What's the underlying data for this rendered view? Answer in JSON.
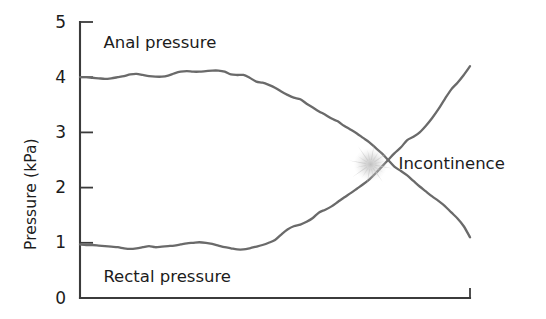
{
  "chart_data": {
    "type": "line",
    "title": "",
    "xlabel": "",
    "ylabel": "Pressure (kPa)",
    "ylim": [
      0,
      5
    ],
    "yticks": [
      0,
      1,
      2,
      3,
      4,
      5
    ],
    "ytick_labels": [
      "0",
      "1",
      "2",
      "3",
      "4",
      "5"
    ],
    "xlim": [
      0,
      100
    ],
    "xticks": [],
    "xtick_labels": [],
    "grid": false,
    "legend": "inline-labels",
    "line_color": "#6a6a6a",
    "axis_color": "#3b3b3b",
    "text_color": "#1c1c1c",
    "annotations": [
      {
        "label": "Incontinence",
        "marker": "starburst",
        "marker_color": "#c9c9c9",
        "x": 74.5,
        "y": 2.42
      }
    ],
    "series": [
      {
        "name": "Anal pressure",
        "label_x": 6,
        "label_y": 4.62,
        "x": [
          0.0,
          1.6,
          3.2,
          4.8,
          6.4,
          8.0,
          9.7,
          11.3,
          12.9,
          14.5,
          16.1,
          17.7,
          19.3,
          21.0,
          22.6,
          24.2,
          25.8,
          27.4,
          29.0,
          30.6,
          32.3,
          33.9,
          35.5,
          37.1,
          38.7,
          40.3,
          41.9,
          43.5,
          45.2,
          46.8,
          48.4,
          50.0,
          51.6,
          53.2,
          54.8,
          56.5,
          58.1,
          59.7,
          61.3,
          62.9,
          64.5,
          66.1,
          67.7,
          69.4,
          71.0,
          72.6,
          74.2,
          75.8,
          77.4,
          79.0,
          80.6,
          82.3,
          83.9,
          85.5,
          87.1,
          88.7,
          90.3,
          91.9,
          93.5,
          95.2,
          96.8,
          98.4,
          100.0
        ],
        "y": [
          4.0,
          4.0,
          3.99,
          3.98,
          3.97,
          3.98,
          4.0,
          4.02,
          4.05,
          4.06,
          4.04,
          4.02,
          4.01,
          4.01,
          4.03,
          4.07,
          4.1,
          4.11,
          4.1,
          4.1,
          4.11,
          4.12,
          4.12,
          4.1,
          4.05,
          4.04,
          4.04,
          3.99,
          3.92,
          3.9,
          3.86,
          3.81,
          3.74,
          3.68,
          3.63,
          3.6,
          3.52,
          3.45,
          3.38,
          3.32,
          3.25,
          3.2,
          3.12,
          3.05,
          2.98,
          2.9,
          2.82,
          2.72,
          2.62,
          2.5,
          2.38,
          2.3,
          2.22,
          2.12,
          2.02,
          1.93,
          1.84,
          1.76,
          1.67,
          1.55,
          1.44,
          1.3,
          1.1
        ]
      },
      {
        "name": "Rectal pressure",
        "label_x": 6,
        "label_y": 0.38,
        "x": [
          0.0,
          1.6,
          3.2,
          4.8,
          6.4,
          8.0,
          9.7,
          11.3,
          12.9,
          14.5,
          16.1,
          17.7,
          19.3,
          21.0,
          22.6,
          24.2,
          25.8,
          27.4,
          29.0,
          30.6,
          32.3,
          33.9,
          35.5,
          37.1,
          38.7,
          40.3,
          41.9,
          43.5,
          45.2,
          46.8,
          48.4,
          50.0,
          51.6,
          53.2,
          54.8,
          56.5,
          58.1,
          59.7,
          61.3,
          62.9,
          64.5,
          66.1,
          67.7,
          69.4,
          71.0,
          72.6,
          74.2,
          75.8,
          77.4,
          79.0,
          80.6,
          82.3,
          83.9,
          85.5,
          87.1,
          88.7,
          90.3,
          91.9,
          93.5,
          95.2,
          96.8,
          98.4,
          100.0
        ],
        "y": [
          0.97,
          0.96,
          0.96,
          0.95,
          0.94,
          0.93,
          0.92,
          0.9,
          0.89,
          0.9,
          0.92,
          0.94,
          0.92,
          0.93,
          0.94,
          0.95,
          0.97,
          0.99,
          1.0,
          1.01,
          1.0,
          0.98,
          0.95,
          0.92,
          0.9,
          0.88,
          0.88,
          0.9,
          0.93,
          0.96,
          1.0,
          1.05,
          1.15,
          1.24,
          1.3,
          1.33,
          1.38,
          1.45,
          1.55,
          1.6,
          1.66,
          1.74,
          1.82,
          1.9,
          1.98,
          2.06,
          2.15,
          2.26,
          2.38,
          2.5,
          2.62,
          2.73,
          2.86,
          2.92,
          3.0,
          3.12,
          3.26,
          3.42,
          3.6,
          3.78,
          3.9,
          4.04,
          4.2
        ]
      }
    ]
  },
  "axis_title": {
    "y": "Pressure (kPa)"
  }
}
